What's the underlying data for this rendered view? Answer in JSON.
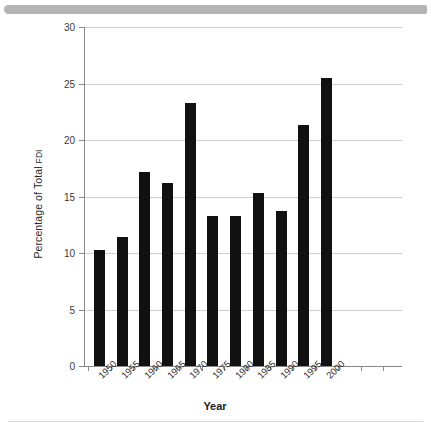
{
  "banner": {
    "name": "top-banner"
  },
  "chart_data": {
    "type": "bar",
    "title": "",
    "xlabel": "Year",
    "ylabel": "Percentage of Total FDI",
    "ylabel_main": "Percentage of Total ",
    "ylabel_small": "FDI",
    "categories": [
      "1950",
      "1955",
      "1960",
      "1965",
      "1970",
      "1975",
      "1980",
      "1985",
      "1990",
      "1995",
      "2000"
    ],
    "values": [
      10.3,
      11.4,
      17.2,
      16.2,
      23.3,
      13.3,
      13.3,
      15.3,
      13.7,
      21.3,
      25.5
    ],
    "ylim": [
      0,
      30
    ],
    "yticks": [
      0,
      5,
      10,
      15,
      20,
      25,
      30
    ],
    "yticklabels": [
      "0",
      "5",
      "10",
      "15",
      "20",
      "25",
      "30"
    ],
    "grid": "horizontal",
    "legend": "none",
    "bar_color": "#111111",
    "grid_color": "#cfcfcf",
    "axis_color": "#8a8a8a"
  }
}
